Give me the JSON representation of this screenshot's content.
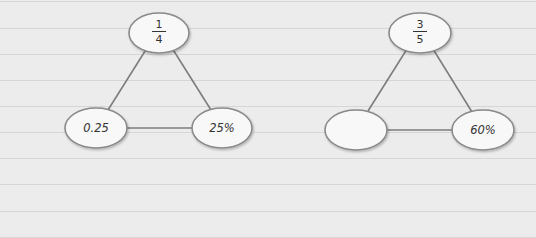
{
  "diagrams": [
    {
      "name": "triangle-one-quarter",
      "top": {
        "numerator": "1",
        "denominator": "4"
      },
      "bottom_left": {
        "label": "0.25"
      },
      "bottom_right": {
        "label": "25%"
      }
    },
    {
      "name": "triangle-three-fifths",
      "top": {
        "numerator": "3",
        "denominator": "5"
      },
      "bottom_left": {
        "label": ""
      },
      "bottom_right": {
        "label": "60%"
      }
    }
  ],
  "colors": {
    "background": "#ececec",
    "paper_lines": "#d6d6d6",
    "ellipse_fill": "#f8f8f8",
    "stroke": "#8a8a8a",
    "text": "#333333"
  }
}
